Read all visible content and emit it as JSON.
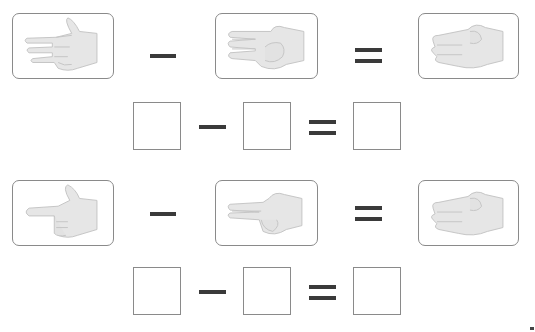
{
  "worksheet": {
    "problems": [
      {
        "hands": [
          {
            "gesture": "three-fingers-pointing-left",
            "count": 3
          },
          {
            "gesture": "two-fingers-pointing-left",
            "count": 2
          },
          {
            "gesture": "one-finger-pointing-left",
            "count": 1
          }
        ],
        "operator1": "−",
        "operator2": "=",
        "answer_boxes": [
          "",
          "",
          ""
        ]
      },
      {
        "hands": [
          {
            "gesture": "one-finger-pointing-left",
            "count": 1
          },
          {
            "gesture": "two-fingers-pointing-left",
            "count": 2
          },
          {
            "gesture": "one-finger-pointing-left",
            "count": 1
          }
        ],
        "operator1": "−",
        "operator2": "=",
        "answer_boxes": [
          "",
          "",
          ""
        ]
      }
    ]
  },
  "colors": {
    "frame_border": "#8a8a8a",
    "operator": "#3a3a3a",
    "hand_fill": "#e6e6e6",
    "hand_shade": "#c4c4c4"
  }
}
